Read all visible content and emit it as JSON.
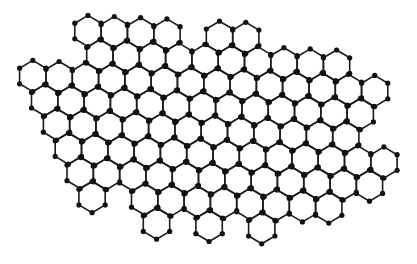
{
  "figure": {
    "type": "hexagonal-lattice",
    "width": 417,
    "height": 264,
    "background_color": "#ffffff",
    "bond_color": "#1c1c1c",
    "atom_color": "#111111",
    "atom_radius": 2.6,
    "bond_width": 1.6
  },
  "lattice": {
    "orientation": "pointy-top",
    "hex_width": 26.3,
    "row_spacing": 23.7,
    "vertex_half_height": 15.6,
    "origin_x": 88,
    "origin_y": 31,
    "row_shear_x": -1.3,
    "slope_y_per_x": 0.044,
    "rows": [
      {
        "row": 1,
        "offset": 0,
        "columns": [
          0,
          1,
          2,
          3,
          5,
          6
        ]
      },
      {
        "row": 2,
        "offset": 1,
        "columns": [
          0,
          1,
          2,
          3,
          4,
          5,
          6,
          7,
          8,
          9
        ]
      },
      {
        "row": 3,
        "offset": 0,
        "columns": [
          -2,
          -1,
          0,
          1,
          2,
          3,
          4,
          5,
          6,
          7,
          8,
          9,
          10,
          11
        ]
      },
      {
        "row": 4,
        "offset": 1,
        "columns": [
          -2,
          -1,
          0,
          1,
          2,
          3,
          4,
          5,
          6,
          7,
          8,
          9,
          10
        ]
      },
      {
        "row": 5,
        "offset": 0,
        "columns": [
          -1,
          0,
          1,
          2,
          3,
          4,
          5,
          6,
          7,
          8,
          9,
          10
        ]
      },
      {
        "row": 6,
        "offset": 1,
        "columns": [
          -1,
          0,
          1,
          2,
          3,
          4,
          5,
          6,
          7,
          8,
          9,
          10,
          11
        ]
      },
      {
        "row": 7,
        "offset": 0,
        "columns": [
          0,
          1,
          2,
          3,
          4,
          5,
          6,
          7,
          8,
          9,
          10,
          11
        ]
      },
      {
        "row": 8,
        "offset": 1,
        "columns": [
          0,
          2,
          3,
          4,
          5,
          6,
          7,
          8,
          9
        ]
      },
      {
        "row": 9,
        "offset": 0,
        "columns": [
          3,
          5,
          7
        ]
      }
    ],
    "hexagon_count": 97
  }
}
